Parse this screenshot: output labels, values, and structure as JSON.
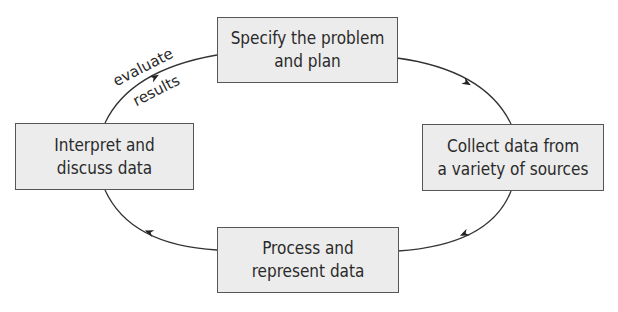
{
  "diagram": {
    "type": "cycle",
    "direction": "clockwise",
    "colors": {
      "box_fill": "#ececec",
      "box_border": "#555555",
      "line": "#333333",
      "text": "#2a2a2a"
    },
    "nodes": [
      {
        "id": "specify",
        "line1": "Specify the problem",
        "line2": "and plan"
      },
      {
        "id": "collect",
        "line1": "Collect data from",
        "line2": "a variety of sources"
      },
      {
        "id": "process",
        "line1": "Process and",
        "line2": "represent data"
      },
      {
        "id": "interpret",
        "line1": "Interpret and",
        "line2": "discuss data"
      }
    ],
    "edges": [
      {
        "from": "specify",
        "to": "collect"
      },
      {
        "from": "collect",
        "to": "process"
      },
      {
        "from": "process",
        "to": "interpret"
      },
      {
        "from": "interpret",
        "to": "specify",
        "label_line1": "evaluate",
        "label_line2": "results"
      }
    ]
  }
}
